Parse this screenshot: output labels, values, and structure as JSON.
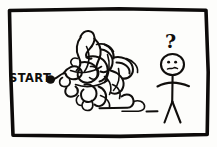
{
  "panel": {
    "type": "hand-drawn-comic-panel",
    "background_color": "#fdfdfb",
    "ink_color": "#100e0c",
    "border_style": "rough rectangle"
  },
  "labels": {
    "start_text": "START",
    "question_mark": "?"
  },
  "elements": {
    "start_dot": "start-point-dot",
    "maze": "tangled-scribble-maze",
    "path_tail": "winding-path-to-figure",
    "figure": "confused-stick-figure",
    "figure_expression": "puzzled-frown"
  },
  "icons": {
    "start_dot_icon": "filled-circle-icon",
    "question_icon": "question-mark-icon",
    "head_icon": "stick-figure-head-icon"
  }
}
